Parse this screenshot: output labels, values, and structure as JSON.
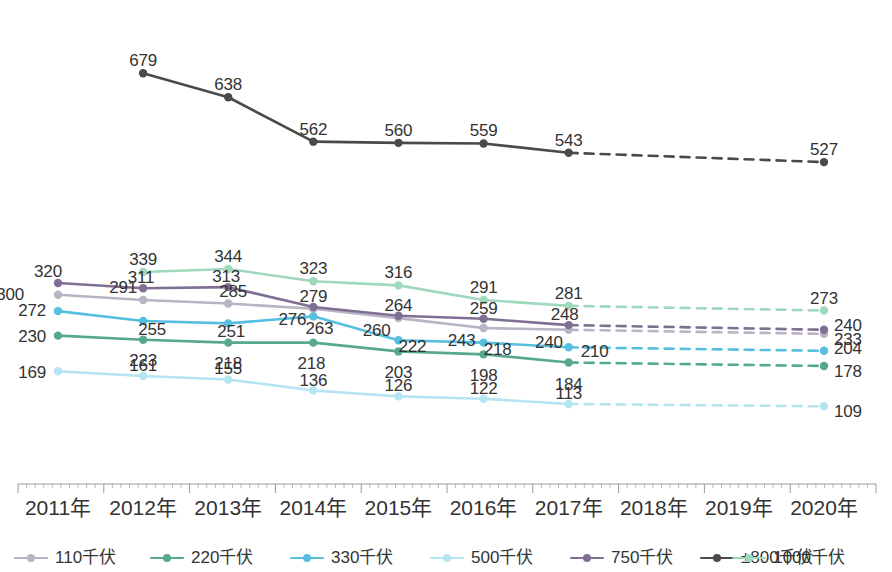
{
  "chart_data": {
    "type": "line",
    "title": "",
    "subtitle": "",
    "xlabel": "",
    "ylabel": "",
    "grid": false,
    "legend_position": "bottom",
    "categories": [
      "2011年",
      "2012年",
      "2013年",
      "2014年",
      "2015年",
      "2016年",
      "2017年",
      "2018年",
      "2019年",
      "2020年"
    ],
    "ylim": [
      0,
      760
    ],
    "forecast_note": "Values from 2017年 to 2020年 are drawn as dashed projections; 2018年 and 2019年 have no plotted data points.",
    "series": [
      {
        "name": "110千伏",
        "color": "#b8b4c4",
        "values": [
          300,
          291,
          285,
          276,
          260,
          243,
          240,
          null,
          null,
          233
        ],
        "labels": [
          "300",
          "291",
          "285",
          "276",
          "260",
          "243",
          "240",
          "",
          "",
          "233"
        ]
      },
      {
        "name": "220千伏",
        "color": "#56a98f",
        "values": [
          230,
          223,
          218,
          218,
          203,
          198,
          184,
          null,
          null,
          178
        ],
        "labels": [
          "230",
          "223",
          "218",
          "218",
          "203",
          "198",
          "184",
          "",
          "",
          "178"
        ]
      },
      {
        "name": "330千伏",
        "color": "#56bfe0",
        "values": [
          272,
          255,
          251,
          263,
          222,
          218,
          210,
          null,
          null,
          204
        ],
        "labels": [
          "272",
          "255",
          "251",
          "263",
          "222",
          "218",
          "210",
          "",
          "",
          "204"
        ]
      },
      {
        "name": "500千伏",
        "color": "#b5e4f2",
        "values": [
          169,
          161,
          155,
          136,
          126,
          122,
          113,
          null,
          null,
          109
        ],
        "labels": [
          "169",
          "161",
          "155",
          "136",
          "126",
          "122",
          "113",
          "",
          "",
          "109"
        ]
      },
      {
        "name": "750千伏",
        "color": "#7e6f93",
        "values": [
          320,
          311,
          313,
          279,
          264,
          259,
          248,
          null,
          null,
          240
        ],
        "labels": [
          "320",
          "311",
          "313",
          "279",
          "264",
          "259",
          "248",
          "",
          "",
          "240"
        ]
      },
      {
        "name": "±800千伏",
        "color": "#4a4a46",
        "values": [
          null,
          679,
          638,
          562,
          560,
          559,
          543,
          null,
          null,
          527
        ],
        "labels": [
          "",
          "679",
          "638",
          "562",
          "560",
          "559",
          "543",
          "",
          "",
          "527"
        ]
      },
      {
        "name": "1000千伏",
        "color": "#9fd9bd",
        "values": [
          null,
          339,
          344,
          323,
          316,
          291,
          281,
          null,
          null,
          273
        ],
        "labels": [
          "",
          "339",
          "344",
          "323",
          "316",
          "291",
          "281",
          "",
          "",
          "273"
        ]
      }
    ]
  },
  "legend": {
    "items": [
      {
        "label": "110千伏",
        "color": "#b8b4c4",
        "icon": "line-marker-icon"
      },
      {
        "label": "220千伏",
        "color": "#56a98f",
        "icon": "line-marker-icon"
      },
      {
        "label": "330千伏",
        "color": "#56bfe0",
        "icon": "line-marker-icon"
      },
      {
        "label": "500千伏",
        "color": "#b5e4f2",
        "icon": "line-marker-icon"
      },
      {
        "label": "750千伏",
        "color": "#7e6f93",
        "icon": "line-marker-icon"
      },
      {
        "label": "±800千伏",
        "color": "#4a4a46",
        "icon": "line-marker-icon"
      },
      {
        "label": "1000千伏",
        "color": "#9fd9bd",
        "icon": "line-marker-icon"
      }
    ]
  },
  "axis": {
    "line_color": "#9a9a9a",
    "ticks": [
      "2011年",
      "2012年",
      "2013年",
      "2014年",
      "2015年",
      "2016年",
      "2017年",
      "2018年",
      "2019年",
      "2020年"
    ]
  },
  "label_overrides": {
    "110千伏": [
      {
        "i": 0,
        "dx": -34,
        "dy": -1,
        "anchor": "end"
      },
      {
        "i": 1,
        "dx": -6,
        "dy": -13,
        "anchor": "end"
      },
      {
        "i": 2,
        "dx": 5,
        "dy": -13,
        "anchor": "middle"
      },
      {
        "i": 3,
        "dx": -7,
        "dy": 10,
        "anchor": "end"
      },
      {
        "i": 4,
        "dx": -8,
        "dy": 12,
        "anchor": "end"
      },
      {
        "i": 5,
        "dx": -8,
        "dy": 12,
        "anchor": "end"
      },
      {
        "i": 6,
        "dx": -6,
        "dy": 12,
        "anchor": "end"
      },
      {
        "i": 9,
        "dx": 10,
        "dy": 5,
        "anchor": "start"
      }
    ],
    "220千伏": [
      {
        "i": 0,
        "dx": -12,
        "dy": 0,
        "anchor": "end"
      },
      {
        "i": 1,
        "dx": 0,
        "dy": 20,
        "anchor": "middle"
      },
      {
        "i": 2,
        "dx": 0,
        "dy": 20,
        "anchor": "middle"
      },
      {
        "i": 3,
        "dx": -2,
        "dy": 20,
        "anchor": "middle"
      },
      {
        "i": 4,
        "dx": 0,
        "dy": 21,
        "anchor": "middle"
      },
      {
        "i": 5,
        "dx": 0,
        "dy": 21,
        "anchor": "middle"
      },
      {
        "i": 6,
        "dx": 0,
        "dy": 21,
        "anchor": "middle"
      },
      {
        "i": 9,
        "dx": 10,
        "dy": 5,
        "anchor": "start"
      }
    ],
    "330千伏": [
      {
        "i": 0,
        "dx": -12,
        "dy": -1,
        "anchor": "end"
      },
      {
        "i": 1,
        "dx": 9,
        "dy": 8,
        "anchor": "middle"
      },
      {
        "i": 2,
        "dx": 3,
        "dy": 8,
        "anchor": "middle"
      },
      {
        "i": 3,
        "dx": 6,
        "dy": 12,
        "anchor": "middle"
      },
      {
        "i": 4,
        "dx": 14,
        "dy": 6,
        "anchor": "middle"
      },
      {
        "i": 5,
        "dx": 14,
        "dy": 6,
        "anchor": "middle"
      },
      {
        "i": 6,
        "dx": 12,
        "dy": 4,
        "anchor": "start"
      },
      {
        "i": 9,
        "dx": 10,
        "dy": -3,
        "anchor": "start"
      }
    ],
    "500千伏": [
      {
        "i": 0,
        "dx": -12,
        "dy": 1,
        "anchor": "end"
      },
      {
        "i": 1,
        "dx": 0,
        "dy": -11,
        "anchor": "middle"
      },
      {
        "i": 2,
        "dx": 0,
        "dy": -11,
        "anchor": "middle"
      },
      {
        "i": 3,
        "dx": 0,
        "dy": -11,
        "anchor": "middle"
      },
      {
        "i": 4,
        "dx": 0,
        "dy": -11,
        "anchor": "middle"
      },
      {
        "i": 5,
        "dx": 0,
        "dy": -11,
        "anchor": "middle"
      },
      {
        "i": 6,
        "dx": 0,
        "dy": -11,
        "anchor": "middle"
      },
      {
        "i": 9,
        "dx": 10,
        "dy": 5,
        "anchor": "start"
      }
    ],
    "750千伏": [
      {
        "i": 0,
        "dx": -10,
        "dy": -12,
        "anchor": "middle"
      },
      {
        "i": 1,
        "dx": -2,
        "dy": -11,
        "anchor": "middle"
      },
      {
        "i": 2,
        "dx": -2,
        "dy": -11,
        "anchor": "middle"
      },
      {
        "i": 3,
        "dx": 0,
        "dy": -11,
        "anchor": "middle"
      },
      {
        "i": 4,
        "dx": 0,
        "dy": -11,
        "anchor": "middle"
      },
      {
        "i": 5,
        "dx": 0,
        "dy": -11,
        "anchor": "middle"
      },
      {
        "i": 6,
        "dx": -4,
        "dy": -11,
        "anchor": "middle"
      },
      {
        "i": 9,
        "dx": 10,
        "dy": -5,
        "anchor": "start"
      }
    ],
    "±800千伏": [
      {
        "i": 1,
        "dx": 0,
        "dy": -13,
        "anchor": "middle"
      },
      {
        "i": 2,
        "dx": 0,
        "dy": -13,
        "anchor": "middle"
      },
      {
        "i": 3,
        "dx": 0,
        "dy": -13,
        "anchor": "middle"
      },
      {
        "i": 4,
        "dx": 0,
        "dy": -13,
        "anchor": "middle"
      },
      {
        "i": 5,
        "dx": 0,
        "dy": -13,
        "anchor": "middle"
      },
      {
        "i": 6,
        "dx": 0,
        "dy": -13,
        "anchor": "middle"
      },
      {
        "i": 9,
        "dx": 0,
        "dy": -13,
        "anchor": "middle"
      }
    ],
    "1000千伏": [
      {
        "i": 1,
        "dx": 0,
        "dy": -13,
        "anchor": "middle"
      },
      {
        "i": 2,
        "dx": 0,
        "dy": -13,
        "anchor": "middle"
      },
      {
        "i": 3,
        "dx": 0,
        "dy": -13,
        "anchor": "middle"
      },
      {
        "i": 4,
        "dx": 0,
        "dy": -13,
        "anchor": "middle"
      },
      {
        "i": 5,
        "dx": 0,
        "dy": -13,
        "anchor": "middle"
      },
      {
        "i": 6,
        "dx": 0,
        "dy": -13,
        "anchor": "middle"
      },
      {
        "i": 9,
        "dx": 0,
        "dy": -13,
        "anchor": "middle"
      }
    ]
  }
}
